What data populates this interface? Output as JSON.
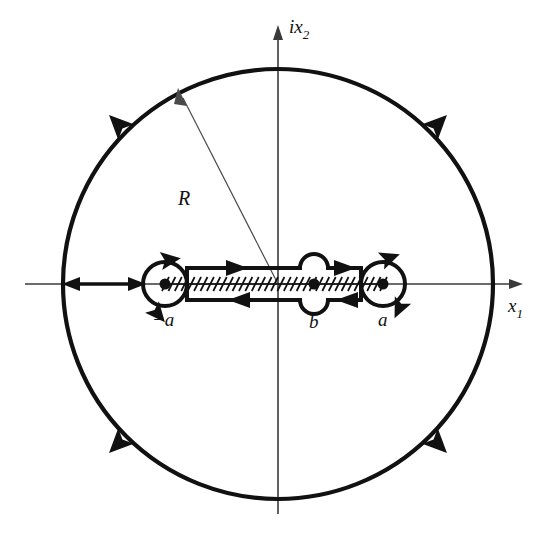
{
  "figure": {
    "kind": "complex-plane-contour-diagram",
    "background_color": "#ffffff",
    "ink_color": "#111111",
    "axis_color": "#3a3a3a"
  },
  "axes": {
    "horizontal": {
      "label_base": "x",
      "label_sub": "1",
      "label_full": "x1",
      "arrow_direction": "right"
    },
    "vertical": {
      "label_prefix": "i",
      "label_base": "x",
      "label_sub": "2",
      "label_full": "ix2",
      "arrow_direction": "up"
    },
    "origin": {
      "x": 278,
      "y": 284
    }
  },
  "outer_circle": {
    "center_x": 278,
    "center_y": 284,
    "radius": 215,
    "orientation": "counterclockwise",
    "stroke_width": 4.2,
    "arrow_angles_deg": [
      135,
      45,
      225,
      315
    ],
    "radius_marker": {
      "label": "R",
      "label_x": 187,
      "label_y": 200,
      "from_x": 278,
      "from_y": 284,
      "to_angle_deg": 127
    }
  },
  "branch_points": [
    {
      "name": "minus-a",
      "label": "-a",
      "x": 165,
      "y": 284,
      "label_x": 157,
      "label_y": 322,
      "aperture": "full-circle",
      "radius": 22
    },
    {
      "name": "b",
      "label": "b",
      "x": 314,
      "y": 284,
      "label_x": 310,
      "label_y": 324,
      "aperture": "small-bump",
      "radius": 14
    },
    {
      "name": "a",
      "label": "a",
      "x": 383,
      "y": 284,
      "label_x": 377,
      "label_y": 322,
      "aperture": "full-circle",
      "radius": 22
    }
  ],
  "branch_cut": {
    "from_x": 165,
    "to_x": 383,
    "y": 284,
    "hatching": true,
    "hatch_count": 34,
    "hatch_slant": "forward"
  },
  "contour": {
    "name": "dogbone-contour",
    "orientation": "clockwise-around-cut",
    "upper_direction": "rightward",
    "lower_direction": "leftward",
    "offset": 16,
    "arrow_positions": [
      {
        "name": "upper-left-arrow",
        "x": 238,
        "y": 268,
        "dir": "right"
      },
      {
        "name": "upper-right-arrow",
        "x": 348,
        "y": 268,
        "dir": "right"
      },
      {
        "name": "lower-left-arrow",
        "x": 248,
        "y": 300,
        "dir": "left"
      },
      {
        "name": "lower-right-arrow",
        "x": 355,
        "y": 300,
        "dir": "left"
      }
    ]
  },
  "axis_segment": {
    "name": "negative-axis-connector",
    "from_x": 63,
    "to_x": 143,
    "y": 284,
    "double_headed": true
  },
  "labels": {
    "R": "R",
    "minus_a": "−a",
    "b": "b",
    "a": "a",
    "x1_base": "x",
    "x1_sub": "1",
    "ix2_prefix": "i",
    "ix2_base": "x",
    "ix2_sub": "2"
  }
}
